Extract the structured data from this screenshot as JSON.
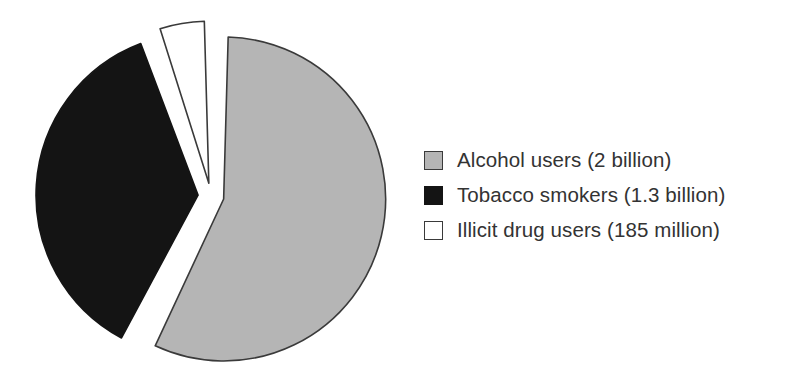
{
  "chart_data": {
    "type": "pie",
    "title": "",
    "subtitle": "",
    "xlabel": "",
    "ylabel": "",
    "grid": false,
    "legend_position": "right",
    "exploded": true,
    "units": "people",
    "total_label": "3.485 billion",
    "categories": [
      "Alcohol users",
      "Tobacco smokers",
      "Illicit drug users"
    ],
    "values": [
      2,
      1.3,
      0.185
    ],
    "value_unit": "billion",
    "percentages": [
      57.4,
      37.3,
      5.3
    ],
    "colors": [
      "#b5b5b5",
      "#141414",
      "#ffffff"
    ],
    "slices": [
      {
        "label": "Alcohol users",
        "value_text": "2 billion",
        "value": 2,
        "percent": 57.4,
        "fill": "#b5b5b5",
        "stroke": "#3a3a3a"
      },
      {
        "label": "Tobacco smokers",
        "value_text": "1.3 billion",
        "value": 1.3,
        "percent": 37.3,
        "fill": "#141414",
        "stroke": "#141414"
      },
      {
        "label": "Illicit drug users",
        "value_text": "185 million",
        "value": 0.185,
        "percent": 5.3,
        "fill": "#ffffff",
        "stroke": "#3a3a3a"
      }
    ]
  },
  "legend": {
    "items": [
      {
        "text": "Alcohol users (2 billion)",
        "swatch_fill": "#b5b5b5",
        "swatch_stroke": "#3a3a3a",
        "swatch_name": "legend-swatch-alcohol"
      },
      {
        "text": "Tobacco smokers (1.3 billion)",
        "swatch_fill": "#141414",
        "swatch_stroke": "#141414",
        "swatch_name": "legend-swatch-tobacco"
      },
      {
        "text": "Illicit drug users (185 million)",
        "swatch_fill": "#ffffff",
        "swatch_stroke": "#3a3a3a",
        "swatch_name": "legend-swatch-illicit"
      }
    ]
  }
}
